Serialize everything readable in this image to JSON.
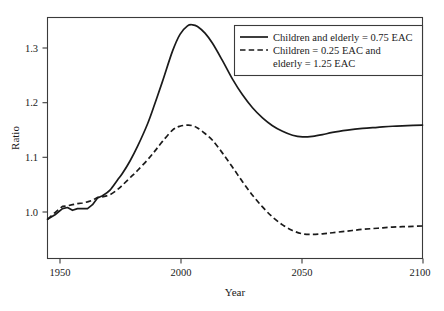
{
  "chart_data": {
    "type": "line",
    "title": "",
    "xlabel": "Year",
    "ylabel": "Ratio",
    "xlim": [
      1950,
      2100
    ],
    "ylim": [
      0.93,
      1.36
    ],
    "xticks": [
      1950,
      2000,
      2050,
      2100
    ],
    "xtick_labels": [
      "1950",
      "2000",
      "2050",
      "2100"
    ],
    "yticks": [
      1.0,
      1.1,
      1.2,
      1.3
    ],
    "ytick_labels": [
      "1.0",
      "1.1",
      "1.2",
      "1.3"
    ],
    "grid": false,
    "legend_position": "top-right",
    "line_color": "#1a1a1a",
    "frame_color": "#3a3a3a",
    "background": "#ffffff",
    "series": [
      {
        "name": "Children and elderly = 0.75 EAC",
        "style": "solid",
        "x": [
          1950,
          1953,
          1956,
          1958,
          1960,
          1962,
          1964,
          1966,
          1968,
          1970,
          1972,
          1975,
          1978,
          1980,
          1983,
          1986,
          1990,
          1993,
          1996,
          2000,
          2003,
          2006,
          2008,
          2010,
          2013,
          2016,
          2020,
          2024,
          2028,
          2032,
          2036,
          2040,
          2044,
          2048,
          2052,
          2056,
          2060,
          2064,
          2070,
          2076,
          2082,
          2088,
          2094,
          2100
        ],
        "y": [
          1.0,
          1.008,
          1.019,
          1.021,
          1.016,
          1.019,
          1.019,
          1.019,
          1.026,
          1.038,
          1.042,
          1.052,
          1.07,
          1.082,
          1.104,
          1.13,
          1.17,
          1.207,
          1.246,
          1.3,
          1.33,
          1.345,
          1.347,
          1.344,
          1.332,
          1.314,
          1.283,
          1.25,
          1.222,
          1.199,
          1.181,
          1.167,
          1.157,
          1.15,
          1.147,
          1.148,
          1.151,
          1.155,
          1.159,
          1.162,
          1.164,
          1.166,
          1.167,
          1.168
        ]
      },
      {
        "name": "Children = 0.25 EAC and elderly = 1.25 EAC",
        "style": "dashed",
        "x": [
          1950,
          1953,
          1956,
          1958,
          1960,
          1962,
          1964,
          1966,
          1968,
          1970,
          1972,
          1975,
          1978,
          1980,
          1983,
          1986,
          1990,
          1993,
          1996,
          2000,
          2003,
          2006,
          2008,
          2010,
          2013,
          2016,
          2020,
          2024,
          2028,
          2032,
          2036,
          2040,
          2044,
          2048,
          2052,
          2056,
          2060,
          2064,
          2070,
          2076,
          2082,
          2088,
          2094,
          2100
        ],
        "y": [
          1.0,
          1.012,
          1.023,
          1.024,
          1.026,
          1.028,
          1.029,
          1.031,
          1.034,
          1.039,
          1.04,
          1.044,
          1.053,
          1.061,
          1.074,
          1.087,
          1.106,
          1.122,
          1.139,
          1.159,
          1.166,
          1.168,
          1.167,
          1.163,
          1.153,
          1.141,
          1.118,
          1.093,
          1.067,
          1.043,
          1.022,
          1.004,
          0.99,
          0.98,
          0.974,
          0.973,
          0.974,
          0.976,
          0.979,
          0.982,
          0.984,
          0.986,
          0.987,
          0.988
        ]
      }
    ],
    "legend": [
      {
        "label_lines": [
          "Children and elderly = 0.75 EAC"
        ],
        "style": "solid"
      },
      {
        "label_lines": [
          "Children = 0.25 EAC and",
          "elderly = 1.25 EAC"
        ],
        "style": "dashed"
      }
    ]
  }
}
